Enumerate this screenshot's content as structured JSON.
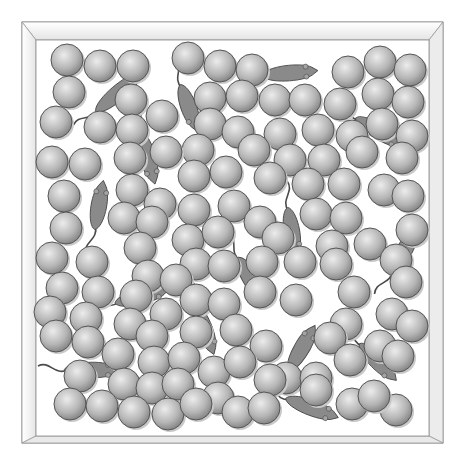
{
  "figure": {
    "box": {
      "outer": [
        22,
        22,
        443,
        443
      ],
      "inner": [
        36,
        40,
        429,
        436
      ],
      "frame_color": "#f2f2f2",
      "edge_color": "#8a8a8a"
    },
    "ball": {
      "radius": 16,
      "fill_light": "#e6e6e6",
      "fill_dark": "#8c8c8c",
      "edge": "#555555"
    },
    "mouse": {
      "fill": "#8a8a8a",
      "edge": "#4a4a4a"
    },
    "balls": [
      [
        67,
        60
      ],
      [
        100,
        66
      ],
      [
        133,
        66
      ],
      [
        188,
        58
      ],
      [
        220,
        66
      ],
      [
        252,
        70
      ],
      [
        348,
        72
      ],
      [
        380,
        62
      ],
      [
        410,
        70
      ],
      [
        69,
        92
      ],
      [
        131,
        100
      ],
      [
        210,
        98
      ],
      [
        242,
        96
      ],
      [
        275,
        100
      ],
      [
        305,
        100
      ],
      [
        340,
        104
      ],
      [
        378,
        94
      ],
      [
        408,
        102
      ],
      [
        56,
        122
      ],
      [
        162,
        116
      ],
      [
        210,
        124
      ],
      [
        238,
        132
      ],
      [
        280,
        134
      ],
      [
        318,
        130
      ],
      [
        352,
        136
      ],
      [
        382,
        124
      ],
      [
        412,
        136
      ],
      [
        100,
        127
      ],
      [
        132,
        130
      ],
      [
        198,
        150
      ],
      [
        254,
        150
      ],
      [
        290,
        160
      ],
      [
        324,
        160
      ],
      [
        362,
        152
      ],
      [
        402,
        158
      ],
      [
        52,
        162
      ],
      [
        85,
        164
      ],
      [
        130,
        158
      ],
      [
        166,
        152
      ],
      [
        194,
        176
      ],
      [
        226,
        172
      ],
      [
        270,
        178
      ],
      [
        308,
        184
      ],
      [
        344,
        184
      ],
      [
        384,
        190
      ],
      [
        64,
        196
      ],
      [
        132,
        190
      ],
      [
        160,
        204
      ],
      [
        194,
        210
      ],
      [
        234,
        206
      ],
      [
        260,
        222
      ],
      [
        316,
        214
      ],
      [
        346,
        218
      ],
      [
        408,
        196
      ],
      [
        66,
        228
      ],
      [
        124,
        218
      ],
      [
        152,
        222
      ],
      [
        188,
        240
      ],
      [
        218,
        232
      ],
      [
        278,
        238
      ],
      [
        332,
        246
      ],
      [
        370,
        244
      ],
      [
        412,
        230
      ],
      [
        52,
        258
      ],
      [
        92,
        262
      ],
      [
        140,
        248
      ],
      [
        196,
        264
      ],
      [
        224,
        266
      ],
      [
        262,
        262
      ],
      [
        300,
        262
      ],
      [
        336,
        264
      ],
      [
        396,
        260
      ],
      [
        62,
        288
      ],
      [
        98,
        292
      ],
      [
        148,
        276
      ],
      [
        176,
        280
      ],
      [
        196,
        300
      ],
      [
        260,
        292
      ],
      [
        354,
        292
      ],
      [
        406,
        282
      ],
      [
        50,
        312
      ],
      [
        86,
        318
      ],
      [
        136,
        296
      ],
      [
        166,
        314
      ],
      [
        224,
        304
      ],
      [
        296,
        300
      ],
      [
        346,
        324
      ],
      [
        392,
        314
      ],
      [
        412,
        326
      ],
      [
        56,
        336
      ],
      [
        88,
        342
      ],
      [
        130,
        324
      ],
      [
        152,
        336
      ],
      [
        196,
        332
      ],
      [
        236,
        330
      ],
      [
        266,
        346
      ],
      [
        330,
        338
      ],
      [
        380,
        346
      ],
      [
        118,
        354
      ],
      [
        154,
        362
      ],
      [
        184,
        358
      ],
      [
        214,
        372
      ],
      [
        240,
        362
      ],
      [
        286,
        378
      ],
      [
        316,
        378
      ],
      [
        350,
        360
      ],
      [
        398,
        356
      ],
      [
        80,
        376
      ],
      [
        124,
        384
      ],
      [
        152,
        388
      ],
      [
        178,
        384
      ],
      [
        218,
        398
      ],
      [
        270,
        380
      ],
      [
        316,
        390
      ],
      [
        352,
        404
      ],
      [
        396,
        410
      ],
      [
        70,
        404
      ],
      [
        102,
        406
      ],
      [
        134,
        412
      ],
      [
        168,
        414
      ],
      [
        196,
        404
      ],
      [
        238,
        412
      ],
      [
        264,
        408
      ],
      [
        374,
        396
      ]
    ],
    "mice": [
      {
        "x": 118,
        "y": 93,
        "angle": -40,
        "len": 58
      },
      {
        "x": 189,
        "y": 108,
        "angle": 70,
        "len": 50
      },
      {
        "x": 148,
        "y": 158,
        "angle": 75,
        "len": 54
      },
      {
        "x": 99,
        "y": 205,
        "angle": -80,
        "len": 50
      },
      {
        "x": 290,
        "y": 73,
        "angle": -5,
        "len": 56
      },
      {
        "x": 380,
        "y": 132,
        "angle": 30,
        "len": 56
      },
      {
        "x": 292,
        "y": 232,
        "angle": 80,
        "len": 50
      },
      {
        "x": 404,
        "y": 251,
        "angle": -60,
        "len": 52
      },
      {
        "x": 142,
        "y": 296,
        "angle": -15,
        "len": 56
      },
      {
        "x": 205,
        "y": 330,
        "angle": 70,
        "len": 52
      },
      {
        "x": 250,
        "y": 278,
        "angle": 60,
        "len": 48
      },
      {
        "x": 302,
        "y": 348,
        "angle": -60,
        "len": 52
      },
      {
        "x": 378,
        "y": 362,
        "angle": 45,
        "len": 52
      },
      {
        "x": 92,
        "y": 370,
        "angle": 0,
        "len": 56
      },
      {
        "x": 312,
        "y": 408,
        "angle": 20,
        "len": 56
      }
    ]
  }
}
